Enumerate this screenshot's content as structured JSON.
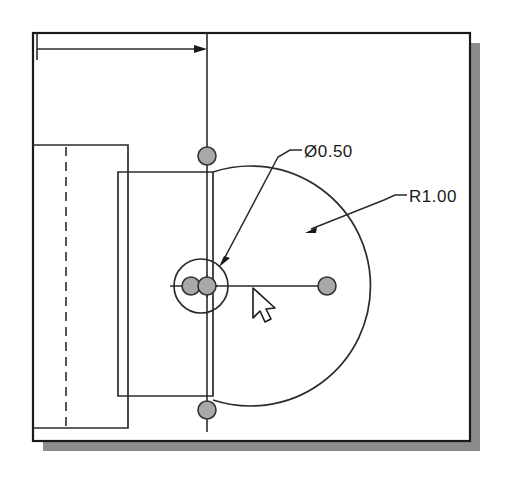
{
  "app": {
    "type": "cad-drawing-view",
    "title": "Technical Drawing Sketch"
  },
  "canvas": {
    "background_color": "#ffffff",
    "page_color": "#ffffff",
    "page_border_color": "#1a1a1a",
    "shadow_color": "#8c8c8c",
    "line_color": "#2b2b2b",
    "handle_fill": "#a8a8a8",
    "handle_stroke": "#333333",
    "cursor_fill": "#ffffff",
    "cursor_stroke": "#1a1a1a"
  },
  "annotations": [
    {
      "id": "diameter-callout",
      "name": "diameter-dimension-label",
      "text": "Ø0.50",
      "x": 304,
      "y": 155,
      "leader_shoulder": {
        "x1": 290,
        "y1": 150,
        "x2": 302,
        "y2": 150
      },
      "leader_path": "M290,150 L278,157 L222,262",
      "arrow_target": {
        "x": 219,
        "y": 266
      }
    },
    {
      "id": "radius-callout",
      "name": "radius-dimension-label",
      "text": "R1.00",
      "x": 409,
      "y": 200,
      "leader_shoulder": {
        "x1": 395,
        "y1": 195,
        "x2": 407,
        "y2": 195
      },
      "leader_path": "M395,195 L384,200 L310,229",
      "arrow_target": {
        "x": 306,
        "y": 232
      }
    }
  ],
  "geometry": {
    "page_rect": {
      "x": 33,
      "y": 33,
      "w": 437,
      "h": 408
    },
    "shadow_rect": {
      "x": 43,
      "y": 43,
      "w": 437,
      "h": 408
    },
    "left_block": {
      "x": 33,
      "y": 145,
      "w": 95,
      "h": 283
    },
    "middle_block": {
      "x": 118,
      "y": 172,
      "w": 95,
      "h": 224
    },
    "hidden_line": {
      "x": 66,
      "y1": 147,
      "y2": 428
    },
    "vertical_centerline": {
      "x": 207,
      "y1": 33,
      "y2": 432
    },
    "horizontal_centerline": {
      "x1": 170,
      "x2": 333,
      "y": 286
    },
    "dimension_line": {
      "x1": 37,
      "x2": 207,
      "y": 49
    },
    "dimension_extension_left": {
      "x": 37,
      "y1": 33,
      "y2": 58
    },
    "small_circle": {
      "cx": 201,
      "cy": 286,
      "r": 27
    },
    "big_arc": {
      "cx": 207,
      "cy": 286,
      "r": 120
    }
  },
  "handles": [
    {
      "name": "handle-top",
      "cx": 207,
      "cy": 156,
      "r": 9
    },
    {
      "name": "handle-right",
      "cx": 327,
      "cy": 286,
      "r": 9
    },
    {
      "name": "handle-bottom",
      "cx": 207,
      "cy": 410,
      "r": 9
    },
    {
      "name": "handle-center-left",
      "cx": 191,
      "cy": 286,
      "r": 9
    },
    {
      "name": "handle-center-right",
      "cx": 207,
      "cy": 286,
      "r": 9
    }
  ],
  "cursor": {
    "name": "mouse-pointer",
    "x": 253,
    "y": 288
  }
}
